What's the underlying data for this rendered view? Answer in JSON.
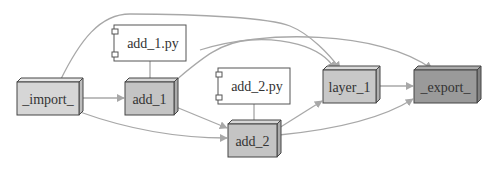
{
  "diagram": {
    "type": "dependency-graph",
    "nodes": [
      {
        "id": "import",
        "label": "_import_",
        "kind": "module",
        "color": "#d6d6d6"
      },
      {
        "id": "add_1",
        "label": "add_1",
        "kind": "module",
        "color": "#c4c4c4"
      },
      {
        "id": "add_1_py",
        "label": "add_1.py",
        "kind": "file"
      },
      {
        "id": "add_2",
        "label": "add_2",
        "kind": "module",
        "color": "#c4c4c4"
      },
      {
        "id": "add_2_py",
        "label": "add_2.py",
        "kind": "file"
      },
      {
        "id": "layer_1",
        "label": "layer_1",
        "kind": "module",
        "color": "#c8c8c8"
      },
      {
        "id": "export",
        "label": "_export_",
        "kind": "module",
        "color": "#9a9a9a"
      }
    ],
    "edges": [
      {
        "from": "import",
        "to": "add_1",
        "arrow": true
      },
      {
        "from": "import",
        "to": "add_2",
        "arrow": true
      },
      {
        "from": "import",
        "to": "layer_1",
        "arrow": true
      },
      {
        "from": "add_1",
        "to": "add_2",
        "arrow": true
      },
      {
        "from": "add_1",
        "to": "layer_1",
        "arrow": true
      },
      {
        "from": "add_1",
        "to": "export",
        "arrow": true
      },
      {
        "from": "add_2",
        "to": "layer_1",
        "arrow": true
      },
      {
        "from": "add_2",
        "to": "export",
        "arrow": true
      },
      {
        "from": "layer_1",
        "to": "export",
        "arrow": true
      },
      {
        "from": "add_1_py",
        "to": "add_1",
        "arrow": false
      },
      {
        "from": "add_2_py",
        "to": "add_2",
        "arrow": false
      }
    ],
    "colors": {
      "edge": "#a8a8a8",
      "link": "#8a8a8a",
      "border": "#444444"
    }
  }
}
